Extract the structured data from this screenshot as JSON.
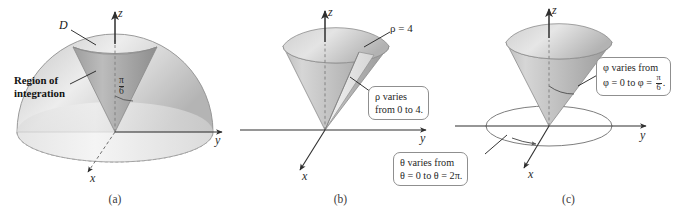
{
  "figure": {
    "panels": [
      {
        "id": "a",
        "caption": "(a)",
        "axes": {
          "x": "x",
          "y": "y",
          "z": "z"
        },
        "labels": {
          "solid": "D",
          "region_line1": "Region of",
          "region_line2": "integration",
          "angle_num": "π",
          "angle_den": "6"
        }
      },
      {
        "id": "b",
        "caption": "(b)",
        "axes": {
          "x": "x",
          "y": "y",
          "z": "z"
        },
        "labels": {
          "rho_equals": "ρ = 4"
        },
        "callouts": [
          {
            "name": "rho-callout",
            "line1_sym": "ρ",
            "line1_rest": " varies",
            "line2": "from 0 to 4."
          }
        ]
      },
      {
        "id": "c",
        "caption": "(c)",
        "axes": {
          "x": "x",
          "y": "y",
          "z": "z"
        },
        "callouts": [
          {
            "name": "phi-callout",
            "line1_sym": "φ",
            "line1_rest": " varies from",
            "line2_pre": "φ = 0 to φ = ",
            "frac_num": "π",
            "frac_den": "6",
            "line2_post": "."
          },
          {
            "name": "theta-callout",
            "line1_sym": "θ",
            "line1_rest": " varies from",
            "line2": "θ = 0 to θ = 2π."
          }
        ]
      }
    ],
    "colors": {
      "axis": "#3c3c3c",
      "surface_light": "#e6e6e6",
      "surface_mid": "#c9c9c9",
      "surface_dark": "#9e9e9e",
      "cone_light": "#dcdcdc",
      "cone_dark": "#a8a8a8",
      "outline": "#8f8f8f",
      "text": "#1f1f1f"
    }
  }
}
